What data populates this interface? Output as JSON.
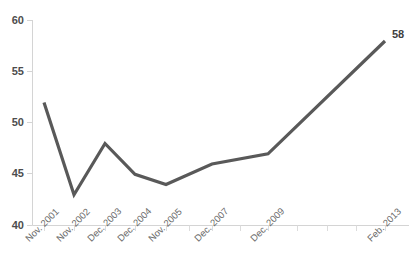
{
  "chart_data": {
    "type": "line",
    "title": "",
    "subtitle": "",
    "xlabel": "",
    "ylabel": "",
    "ylim": [
      40,
      60
    ],
    "yticks": [
      40,
      45,
      50,
      55,
      60
    ],
    "ytick_labels": [
      "40",
      "45",
      "50",
      "55",
      "60"
    ],
    "grid": false,
    "legend": false,
    "legend_position": "none",
    "categories": [
      "Nov. 2001",
      "Nov. 2002",
      "Dec. 2003",
      "Dec. 2004",
      "Nov. 2005",
      "Dec. 2007",
      "Dec. 2009",
      "Feb. 2013"
    ],
    "values": [
      52,
      43,
      48,
      45,
      44,
      46,
      47,
      58
    ],
    "series": [
      {
        "name": "",
        "values": [
          52,
          43,
          48,
          45,
          44,
          46,
          47,
          58
        ],
        "color": "#595959"
      }
    ],
    "annotations": [
      {
        "text": "58",
        "value": 58,
        "category": "Feb. 2013"
      }
    ],
    "line_color": "#595959",
    "axis_color": "#d4d4d4",
    "tick_label_color": "#6b6b6b",
    "value_label_color": "#3f3f3f"
  },
  "axis": {
    "y_labels": [
      "60",
      "55",
      "50",
      "45",
      "40"
    ],
    "x_labels": [
      "Nov. 2001",
      "Nov. 2002",
      "Dec. 2003",
      "Dec. 2004",
      "Nov. 2005",
      "Dec. 2007",
      "Dec. 2009",
      "Feb. 2013"
    ]
  },
  "labels": {
    "last_point": "58"
  }
}
